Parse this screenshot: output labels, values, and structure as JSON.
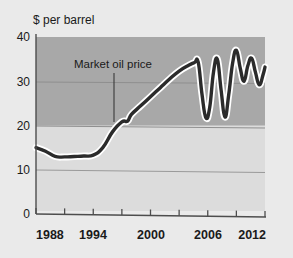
{
  "chart_data": {
    "type": "line",
    "title": "",
    "ylabel": "$ per barrel",
    "xlabel": "",
    "ylim": [
      0,
      40
    ],
    "xlim": [
      1988,
      2012
    ],
    "yticks": [
      0,
      10,
      20,
      30,
      40
    ],
    "ytick_labels": [
      "0",
      "10",
      "20",
      "30",
      "40"
    ],
    "xticks": [
      1988,
      1991,
      1994,
      1997,
      2000,
      2003,
      2006,
      2009,
      2012
    ],
    "xtick_labels": [
      "1988",
      "",
      "1994",
      "",
      "2000",
      "",
      "2006",
      "",
      "2012"
    ],
    "xtick_labels_shown": [
      "1988",
      "1994",
      "2000",
      "2006",
      "2012"
    ],
    "grid": "horizontal gridlines at 10, 20, 30",
    "legend": "none",
    "shaded_band": {
      "from": 20,
      "to": 40,
      "color": "#a8a8a8"
    },
    "plot_background": "#dcdcdc",
    "annotations": [
      {
        "text": "Market oil price",
        "x": 1997,
        "y": 36,
        "leader_to_y": 21
      }
    ],
    "series": [
      {
        "name": "Market oil price",
        "color": "#2b2b2b",
        "halo_color": "#ffffff",
        "x": [
          1988,
          1989,
          1990,
          1991,
          1992,
          1993,
          1994,
          1995,
          1996,
          1997,
          1997.6,
          1998,
          1999,
          2000,
          2001,
          2002,
          2003,
          2004,
          2004.6,
          2005,
          2005.4,
          2005.8,
          2006.2,
          2006.6,
          2007,
          2007.4,
          2007.8,
          2008.2,
          2008.6,
          2009,
          2009.4,
          2009.8,
          2010.2,
          2010.6,
          2011,
          2011.4,
          2011.8,
          2012
        ],
        "y": [
          15.0,
          14.2,
          13.0,
          12.9,
          13.0,
          13.1,
          13.3,
          15.0,
          18.5,
          20.8,
          21.0,
          22.5,
          24.5,
          26.5,
          28.5,
          30.5,
          32.3,
          33.6,
          34.2,
          34.3,
          27.0,
          21.8,
          24.0,
          32.0,
          35.0,
          28.0,
          21.9,
          27.0,
          34.0,
          37.0,
          33.0,
          30.0,
          33.5,
          35.2,
          32.0,
          29.2,
          31.5,
          33.2
        ]
      }
    ]
  },
  "axis": {
    "unit_label": "$ per barrel",
    "y_labels": [
      "40",
      "30",
      "20",
      "10",
      "0"
    ],
    "x_labels": [
      "1988",
      "1994",
      "2000",
      "2006",
      "2012"
    ]
  },
  "annotation": {
    "label": "Market oil price"
  },
  "colors": {
    "page_background": "#eaeaea",
    "plot_background": "#dcdcdc",
    "band": "#a8a8a8",
    "line": "#2b2b2b",
    "line_halo": "#ffffff",
    "axis": "#555555",
    "gridline": "#8a8a8a",
    "text": "#1a1a1a"
  }
}
